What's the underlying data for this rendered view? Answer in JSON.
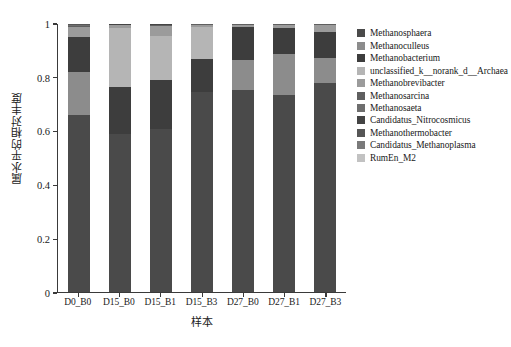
{
  "chart_data": {
    "type": "bar",
    "stacked": true,
    "title": "",
    "xlabel": "样本",
    "ylabel": "属水平的相对丰度",
    "ylim": [
      0,
      1
    ],
    "yticks": [
      "0",
      "0.2",
      "0.4",
      "0.6",
      "0.8",
      "1"
    ],
    "ytick_values": [
      0,
      0.2,
      0.4,
      0.6,
      0.8,
      1
    ],
    "grid": false,
    "legend_position": "right",
    "categories": [
      "D0_B0",
      "D15_B0",
      "D15_B1",
      "D15_B3",
      "D27_B0",
      "D27_B1",
      "D27_B3"
    ],
    "series": [
      {
        "name": "Methanosphaera",
        "color": "#4a4a4a",
        "values": [
          0.66,
          0.59,
          0.61,
          0.745,
          0.755,
          0.735,
          0.78
        ]
      },
      {
        "name": "Methanoculleus",
        "color": "#8c8c8c",
        "values": [
          0.16,
          0.0,
          0.0,
          0.0,
          0.11,
          0.155,
          0.095
        ]
      },
      {
        "name": "Methanobacterium",
        "color": "#3d3d3d",
        "values": [
          0.13,
          0.175,
          0.18,
          0.125,
          0.125,
          0.095,
          0.095
        ]
      },
      {
        "name": "unclassified_k__norank_d__Archaea",
        "color": "#b5b5b5",
        "values": [
          0.0,
          0.22,
          0.165,
          0.12,
          0.0,
          0.0,
          0.0
        ]
      },
      {
        "name": "Methanobrevibacter",
        "color": "#9b9b9b",
        "values": [
          0.038,
          0.01,
          0.038,
          0.008,
          0.008,
          0.013,
          0.028
        ]
      },
      {
        "name": "Methanosarcina",
        "color": "#5f5f5f",
        "values": [
          0.004,
          0.002,
          0.003,
          0.001,
          0.001,
          0.001,
          0.001
        ]
      },
      {
        "name": "Methanosaeta",
        "color": "#6e6e6e",
        "values": [
          0.003,
          0.001,
          0.002,
          0.001,
          0.001,
          0.001,
          0.001
        ]
      },
      {
        "name": "Candidatus_Nitrocosmicus",
        "color": "#444444",
        "values": [
          0.002,
          0.001,
          0.001,
          0.0,
          0.0,
          0.0,
          0.0
        ]
      },
      {
        "name": "Methanothermobacter",
        "color": "#565656",
        "values": [
          0.002,
          0.001,
          0.001,
          0.0,
          0.0,
          0.0,
          0.0
        ]
      },
      {
        "name": "Candidatus_Methanoplasma",
        "color": "#7a7a7a",
        "values": [
          0.001,
          0.0,
          0.0,
          0.0,
          0.0,
          0.0,
          0.0
        ]
      },
      {
        "name": "RumEn_M2",
        "color": "#c2c2c2",
        "values": [
          0.0,
          0.0,
          0.0,
          0.0,
          0.0,
          0.0,
          0.0
        ]
      }
    ]
  },
  "axes": {
    "y_title": "属水平的相对丰度",
    "x_title": "样本",
    "y_tick_labels": [
      "1",
      "0.8",
      "0.6",
      "0.4",
      "0.2",
      "0"
    ],
    "x_tick_labels": [
      "D0_B0",
      "D15_B0",
      "D15_B1",
      "D15_B3",
      "D27_B0",
      "D27_B1",
      "D27_B3"
    ]
  },
  "legend": {
    "items": [
      {
        "label": "Methanosphaera",
        "color": "#4a4a4a"
      },
      {
        "label": "Methanoculleus",
        "color": "#8c8c8c"
      },
      {
        "label": "Methanobacterium",
        "color": "#3d3d3d"
      },
      {
        "label": "unclassified_k__norank_d__Archaea",
        "color": "#b5b5b5"
      },
      {
        "label": "Methanobrevibacter",
        "color": "#9b9b9b"
      },
      {
        "label": "Methanosarcina",
        "color": "#5f5f5f"
      },
      {
        "label": "Methanosaeta",
        "color": "#6e6e6e"
      },
      {
        "label": "Candidatus_Nitrocosmicus",
        "color": "#444444"
      },
      {
        "label": "Methanothermobacter",
        "color": "#565656"
      },
      {
        "label": "Candidatus_Methanoplasma",
        "color": "#7a7a7a"
      },
      {
        "label": "RumEn_M2",
        "color": "#c2c2c2"
      }
    ]
  }
}
